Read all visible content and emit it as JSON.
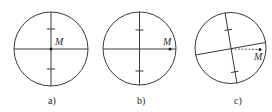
{
  "figure": {
    "panels": [
      {
        "id": "a",
        "caption": "a)",
        "point_label": "M",
        "point_position": "center",
        "crosshair_rotated": false,
        "dashed_link": false
      },
      {
        "id": "b",
        "caption": "b)",
        "point_label": "M",
        "point_position": "on horizontal line near right edge",
        "crosshair_rotated": false,
        "dashed_link": false
      },
      {
        "id": "c",
        "caption": "c)",
        "point_label": "M",
        "point_position": "off crosshair near right edge",
        "crosshair_rotated": true,
        "dashed_link": true
      }
    ],
    "colors": {
      "line": "#3a3a3a",
      "text": "#2a2a2a",
      "background": "#ffffff"
    }
  }
}
